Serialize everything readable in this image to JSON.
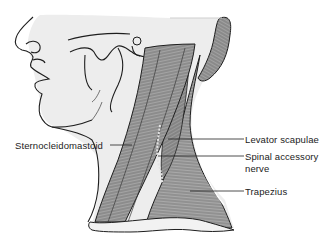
{
  "figure": {
    "colors": {
      "background": "#ffffff",
      "skin_shade": "#ececec",
      "muscle_fill": "#8a8a8a",
      "muscle_dark": "#5a5a5a",
      "muscle_stripe": "#b5b5b5",
      "outline": "#1e1e1e",
      "nerve": "#d8d8d8",
      "leader_line": "#222222"
    }
  },
  "labels": {
    "sternocleidomastoid": "Sternocleidomastoid",
    "levator_scapulae": "Levator scapulae",
    "spinal_accessory_nerve_line1": "Spinal accessory",
    "spinal_accessory_nerve_line2": "nerve",
    "trapezius": "Trapezius"
  }
}
